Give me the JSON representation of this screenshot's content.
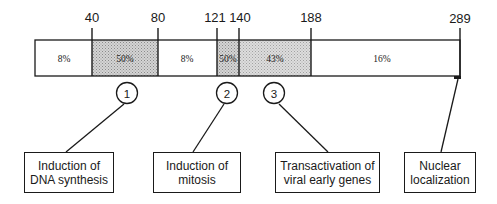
{
  "diagram": {
    "protein_length": 289,
    "positions": [
      "40",
      "80",
      "121",
      "140",
      "188",
      "289"
    ],
    "segments": [
      {
        "start": 1,
        "end": 40,
        "label": "8%",
        "shaded": false
      },
      {
        "start": 40,
        "end": 80,
        "label": "50%",
        "shaded": true
      },
      {
        "start": 80,
        "end": 121,
        "label": "8%",
        "shaded": false
      },
      {
        "start": 121,
        "end": 140,
        "label": "50%",
        "shaded": true
      },
      {
        "start": 140,
        "end": 188,
        "label": "43%",
        "shaded": true
      },
      {
        "start": 188,
        "end": 289,
        "label": "16%",
        "shaded": false
      }
    ],
    "markers": [
      {
        "number": "1",
        "function_index": 0
      },
      {
        "number": "2",
        "function_index": 1
      },
      {
        "number": "3",
        "function_index": 2
      }
    ],
    "functions": [
      {
        "line1": "Induction of",
        "line2": "DNA synthesis"
      },
      {
        "line1": "Induction of",
        "line2": "mitosis"
      },
      {
        "line1": "Transactivation of",
        "line2": "viral early genes"
      },
      {
        "line1": "Nuclear",
        "line2": "localization"
      }
    ],
    "colors": {
      "line": "#1a1a1a",
      "shaded_fill": "#c8c8c8",
      "unshaded_fill": "#ffffff"
    }
  }
}
